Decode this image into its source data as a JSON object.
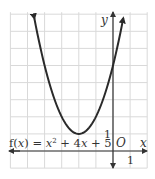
{
  "chart_data": {
    "type": "line",
    "title": "",
    "function_label": "f(x) = x² + 4x + 5",
    "xlabel": "x",
    "ylabel": "y",
    "origin_label": "O",
    "x_tick_label": "1",
    "y_tick_label": "1",
    "xlim": [
      -6,
      2
    ],
    "ylim": [
      -1,
      8
    ],
    "grid": true,
    "legend": "none",
    "series": [
      {
        "name": "f(x) = x^2 + 4x + 5",
        "x": [
          -4.6,
          -4,
          -3,
          -2,
          -1,
          0,
          0.6
        ],
        "values": [
          7.76,
          5,
          2,
          1,
          2,
          5,
          7.76
        ]
      }
    ],
    "vertex": [
      -2,
      1
    ],
    "y_intercept": 5,
    "colors": {
      "grid": "#d9d9d9",
      "axis": "#333333",
      "curve": "#2a2a2a"
    }
  }
}
